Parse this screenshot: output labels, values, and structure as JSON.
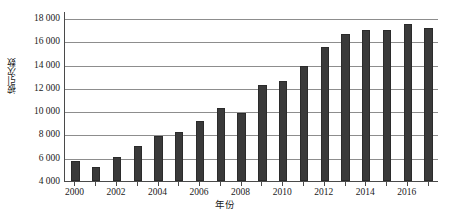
{
  "chart_data": {
    "type": "bar",
    "title": "",
    "subtitle": "",
    "xlabel": "年份",
    "ylabel": "被引次数",
    "categories": [
      2000,
      2001,
      2002,
      2003,
      2004,
      2005,
      2006,
      2007,
      2008,
      2009,
      2010,
      2011,
      2012,
      2013,
      2014,
      2015,
      2016,
      2017
    ],
    "values": [
      5700,
      5200,
      6050,
      7000,
      7900,
      8200,
      9150,
      10300,
      9850,
      12250,
      12550,
      13900,
      15550,
      16650,
      17000,
      16950,
      17500,
      17150
    ],
    "series": [
      {
        "name": "被引次数",
        "values": [
          5700,
          5200,
          6050,
          7000,
          7900,
          8200,
          9150,
          10300,
          9850,
          12250,
          12550,
          13900,
          15550,
          16650,
          17000,
          16950,
          17500,
          17150
        ]
      }
    ],
    "ylim": [
      4000,
      18600
    ],
    "yticks": [
      4000,
      6000,
      8000,
      10000,
      12000,
      14000,
      16000,
      18000
    ],
    "ytick_labels": [
      "4 000",
      "6 000",
      "8 000",
      "10 000",
      "12 000",
      "14 000",
      "16 000",
      "18 000"
    ],
    "xtick_labels": [
      "2000",
      "2002",
      "2004",
      "2006",
      "2008",
      "2010",
      "2012",
      "2014",
      "2016"
    ],
    "xtick_values": [
      2000,
      2002,
      2004,
      2006,
      2008,
      2010,
      2012,
      2014,
      2016
    ],
    "grid": true,
    "grid_axis": "y",
    "legend": false,
    "legend_position": "none",
    "bar_color": "#3a3a3a",
    "grid_color": "#8d8d8d",
    "axis_color": "#4a4a4a",
    "background_color": "#ffffff"
  }
}
